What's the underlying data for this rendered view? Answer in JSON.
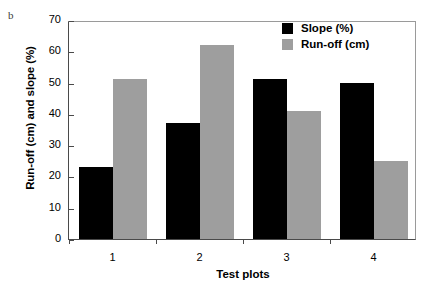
{
  "panel_label": "b",
  "chart_data": {
    "type": "bar",
    "title": "",
    "xlabel": "Test plots",
    "ylabel": "Run-off (cm) and slope (%)",
    "categories": [
      "1",
      "2",
      "3",
      "4"
    ],
    "series": [
      {
        "name": "Slope (%)",
        "color": "#000000",
        "values": [
          23,
          37,
          51,
          50
        ]
      },
      {
        "name": "Run-off (cm)",
        "color": "#9e9e9e",
        "values": [
          51,
          62,
          41,
          25
        ]
      }
    ],
    "ylim": [
      0,
      70
    ],
    "ytick_labels": [
      "0",
      "10",
      "20",
      "30",
      "40",
      "50",
      "60",
      "70"
    ],
    "ytick_values": [
      0,
      10,
      20,
      30,
      40,
      50,
      60,
      70
    ],
    "grid": false,
    "legend_position": "top-right"
  }
}
